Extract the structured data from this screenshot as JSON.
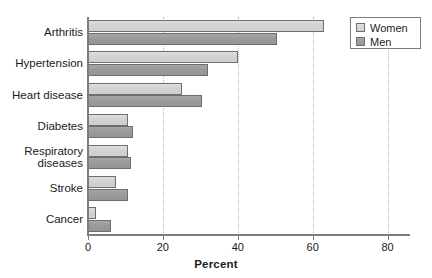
{
  "chart_data": {
    "type": "bar",
    "orientation": "horizontal",
    "title": "",
    "xlabel": "Percent",
    "ylabel": "",
    "xlim": [
      0,
      86
    ],
    "xticks": [
      0,
      20,
      40,
      60,
      80
    ],
    "xtick_labels": [
      "0",
      "20",
      "40",
      "60",
      "80"
    ],
    "grid": "vertical-dotted",
    "legend_position": "top-right",
    "categories": [
      "Arthritis",
      "Hypertension",
      "Heart disease",
      "Diabetes",
      "Respiratory\ndiseases",
      "Stroke",
      "Cancer"
    ],
    "series": [
      {
        "name": "Women",
        "color": "#d2d2d2",
        "values": [
          63,
          40,
          25,
          10.6,
          10.6,
          7.5,
          2.2
        ]
      },
      {
        "name": "Men",
        "color": "#9a9a9a",
        "values": [
          50.5,
          32,
          30.5,
          12,
          11.5,
          10.7,
          6.2
        ]
      }
    ]
  },
  "legend": {
    "items": [
      {
        "label": "Women",
        "swatch": "women"
      },
      {
        "label": "Men",
        "swatch": "men"
      }
    ]
  },
  "axis": {
    "x_title": "Percent"
  },
  "colors": {
    "women_fill": "#d2d2d2",
    "men_fill": "#9a9a9a",
    "bar_stroke": "#6e6e6e",
    "axis": "#7d7d7d",
    "grid": "#b6b6b6",
    "text": "#1a1a1a",
    "background": "#ffffff"
  }
}
